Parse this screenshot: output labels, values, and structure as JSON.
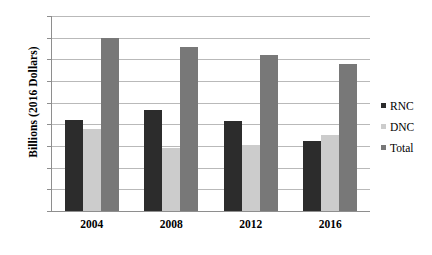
{
  "chart_data": {
    "type": "bar",
    "title": "",
    "xlabel": "",
    "ylabel": "Billions (2016 Dollars)",
    "categories": [
      "2004",
      "2008",
      "2012",
      "2016"
    ],
    "series": [
      {
        "name": "RNC",
        "color": "#2c2c2c",
        "values": [
          420,
          465,
          415,
          325
        ]
      },
      {
        "name": "DNC",
        "color": "#cccccc",
        "values": [
          380,
          290,
          305,
          350
        ]
      },
      {
        "name": "Total",
        "color": "#787878",
        "values": [
          800,
          757,
          722,
          677
        ]
      }
    ],
    "ylim": [
      0,
      900
    ],
    "ytick_step": 100,
    "yticks": [
      "900",
      "800",
      "700",
      "600",
      "500",
      "400",
      "300",
      "200",
      "100",
      "0"
    ],
    "grid": true,
    "legend_position": "right"
  },
  "legend": {
    "items": [
      {
        "label": "RNC"
      },
      {
        "label": "DNC"
      },
      {
        "label": "Total"
      }
    ]
  }
}
